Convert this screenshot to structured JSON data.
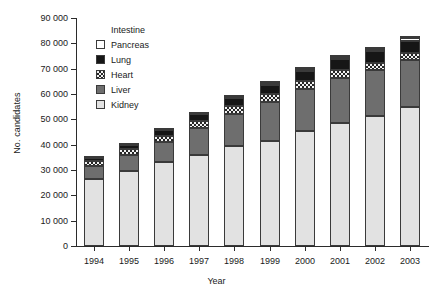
{
  "chart_data": {
    "type": "bar",
    "stacked": true,
    "title": "",
    "xlabel": "Year",
    "ylabel": "No. candidates",
    "categories": [
      "1994",
      "1995",
      "1996",
      "1997",
      "1998",
      "1999",
      "2000",
      "2001",
      "2002",
      "2003"
    ],
    "ylim": [
      0,
      90000
    ],
    "ytick_values": [
      0,
      10000,
      20000,
      30000,
      40000,
      50000,
      60000,
      70000,
      80000,
      90000
    ],
    "ytick_labels": [
      "0",
      "10 000",
      "20 000",
      "30 000",
      "40 000",
      "50 000",
      "60 000",
      "70 000",
      "80 000",
      "90 000"
    ],
    "grid": false,
    "legend_position": "upper-left-inside",
    "series": [
      {
        "name": "Kidney",
        "color": "#e2e2e2",
        "pattern": "solid",
        "values": [
          26500,
          29500,
          33000,
          36000,
          39500,
          41500,
          45500,
          48500,
          51500,
          55000
        ]
      },
      {
        "name": "Liver",
        "color": "#6e6e6e",
        "pattern": "solid",
        "values": [
          5000,
          6500,
          8000,
          10500,
          12500,
          15500,
          16500,
          18000,
          18000,
          18500
        ]
      },
      {
        "name": "Heart",
        "color": "#262626",
        "pattern": "checker",
        "values": [
          2000,
          2200,
          2500,
          3000,
          3200,
          3200,
          3200,
          3000,
          2800,
          2700
        ]
      },
      {
        "name": "Lung",
        "color": "#161616",
        "pattern": "solid",
        "values": [
          1300,
          1700,
          2200,
          2700,
          3100,
          3400,
          3700,
          4200,
          4500,
          4700
        ]
      },
      {
        "name": "Pancreas",
        "color": "#ffffff",
        "pattern": "solid",
        "values": [
          200,
          300,
          400,
          500,
          600,
          700,
          800,
          900,
          1000,
          1100
        ]
      },
      {
        "name": "Intestine",
        "color": "#ffffff",
        "pattern": "solid",
        "values": [
          0,
          0,
          0,
          0,
          100,
          100,
          100,
          100,
          100,
          100
        ]
      }
    ],
    "totals": [
      35000,
      40200,
      46100,
      52700,
      59000,
      64400,
      69800,
      74700,
      77900,
      82100
    ]
  },
  "legend": {
    "entries": [
      {
        "label": "Intestine",
        "swatch": "blank"
      },
      {
        "label": "Pancreas",
        "swatch": "pancreas"
      },
      {
        "label": "Lung",
        "swatch": "lung"
      },
      {
        "label": "Heart",
        "swatch": "heart"
      },
      {
        "label": "Liver",
        "swatch": "liver"
      },
      {
        "label": "Kidney",
        "swatch": "kidney"
      }
    ]
  }
}
